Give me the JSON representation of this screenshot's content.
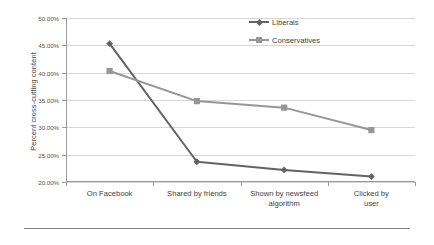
{
  "chart_data": {
    "type": "line",
    "title": "",
    "xlabel": "",
    "ylabel": "Percent cross-cutting content",
    "categories": [
      "On Facebook",
      "Shared by friends",
      "Shown by newsfeed\nalgorithm",
      "Clicked by user"
    ],
    "series": [
      {
        "name": "Liberals",
        "marker": "diamond",
        "color": "#636363",
        "values": [
          45.3,
          23.7,
          22.2,
          21.0
        ]
      },
      {
        "name": "Conservatives",
        "marker": "square",
        "color": "#969696",
        "values": [
          40.3,
          34.8,
          33.6,
          29.5
        ]
      }
    ],
    "ylim": [
      20.0,
      50.0
    ],
    "ytick_values": [
      20.0,
      25.0,
      30.0,
      35.0,
      40.0,
      45.0,
      50.0
    ],
    "ytick_labels": [
      "20.00%",
      "25.00%",
      "30.00%",
      "35.00%",
      "40.00%",
      "45.00%",
      "50.00%"
    ],
    "grid": "horizontal",
    "legend_position": "top-right-inside"
  },
  "axes": {
    "y_title": "Percent cross-cutting content"
  },
  "legend": {
    "entries": [
      {
        "label": "Liberals"
      },
      {
        "label": "Conservatives"
      }
    ]
  },
  "colors": {
    "liberals": "#636363",
    "conservatives": "#969696",
    "gridline": "#d6d6d6",
    "axis": "#9a9a9a",
    "text": "#3f3f3f",
    "rule": "#818181"
  }
}
